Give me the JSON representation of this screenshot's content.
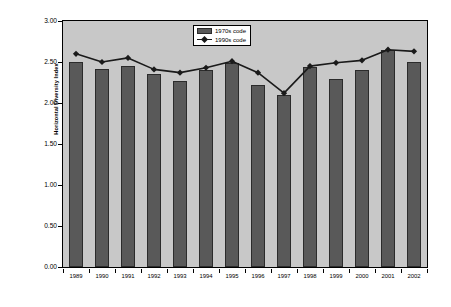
{
  "chart_data": {
    "type": "bar",
    "title": "",
    "xlabel": "",
    "ylabel": "Horizontal Diversity Index",
    "ylim": [
      0.0,
      3.0
    ],
    "ytick_step": 0.5,
    "ytick_labels": [
      "0.00",
      "0.50",
      "1.00",
      "1.50",
      "2.00",
      "2.50",
      "3.00"
    ],
    "ytick_values": [
      0.0,
      0.5,
      1.0,
      1.5,
      2.0,
      2.5,
      3.0
    ],
    "grid": false,
    "legend_position": "top-right",
    "categories": [
      "1989",
      "1990",
      "1991",
      "1992",
      "1993",
      "1994",
      "1995",
      "1996",
      "1997",
      "1998",
      "1999",
      "2000",
      "2001",
      "2002"
    ],
    "series": [
      {
        "name": "1970s code",
        "type": "bar",
        "color": "#595959",
        "values": [
          2.5,
          2.41,
          2.45,
          2.35,
          2.27,
          2.4,
          2.49,
          2.22,
          2.1,
          2.44,
          2.29,
          2.4,
          2.65,
          2.5
        ]
      },
      {
        "name": "1990s code",
        "type": "line",
        "color": "#1a1a1a",
        "marker": "diamond",
        "values": [
          2.6,
          2.5,
          2.55,
          2.41,
          2.37,
          2.43,
          2.51,
          2.37,
          2.12,
          2.45,
          2.49,
          2.52,
          2.65,
          2.63
        ]
      }
    ]
  },
  "legend": {
    "items": [
      {
        "label": "1970s code",
        "swatch": "bar-swatch"
      },
      {
        "label": "1990s code",
        "swatch": "line-marker-swatch"
      }
    ]
  },
  "colors": {
    "bar_fill": "#595959",
    "bar_edge": "#2b2b2b",
    "line": "#1a1a1a",
    "plot_background": "#c8c8c8",
    "page_background": "#ffffff",
    "axis": "#000000"
  }
}
